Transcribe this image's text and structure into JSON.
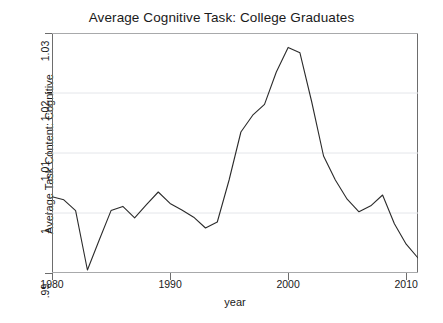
{
  "chart_data": {
    "type": "line",
    "title": "Average Cognitive Task: College Graduates",
    "xlabel": "year",
    "ylabel": "Average Task Content: Cognitive",
    "xlim": [
      1980,
      2011
    ],
    "ylim": [
      0.99,
      1.03
    ],
    "grid": true,
    "grid_axis": "y",
    "legend": null,
    "xticks": [
      1980,
      1990,
      2000,
      2010
    ],
    "xtick_labels": [
      "1980",
      "1990",
      "2000",
      "2010"
    ],
    "yticks": [
      0.99,
      1.0,
      1.01,
      1.02,
      1.03
    ],
    "ytick_labels": [
      ".99",
      "1",
      "1.01",
      "1.02",
      "1.03"
    ],
    "line_color": "#2b2b2b",
    "x": [
      1980,
      1981,
      1982,
      1983,
      1984,
      1985,
      1986,
      1987,
      1988,
      1989,
      1990,
      1991,
      1992,
      1993,
      1994,
      1995,
      1996,
      1997,
      1998,
      1999,
      2000,
      2001,
      2002,
      2003,
      2004,
      2005,
      2006,
      2007,
      2008,
      2009,
      2010,
      2011
    ],
    "values": [
      1.0027,
      1.0022,
      1.0004,
      0.9905,
      0.9955,
      1.0004,
      1.0011,
      0.9992,
      1.0014,
      1.0035,
      1.0016,
      1.0005,
      0.9993,
      0.9975,
      0.9985,
      1.0055,
      1.0135,
      1.0163,
      1.0181,
      1.0235,
      1.0276,
      1.0267,
      1.0185,
      1.0095,
      1.0055,
      1.0023,
      1.0002,
      1.0012,
      1.003,
      0.9982,
      0.9948,
      0.9925
    ]
  }
}
